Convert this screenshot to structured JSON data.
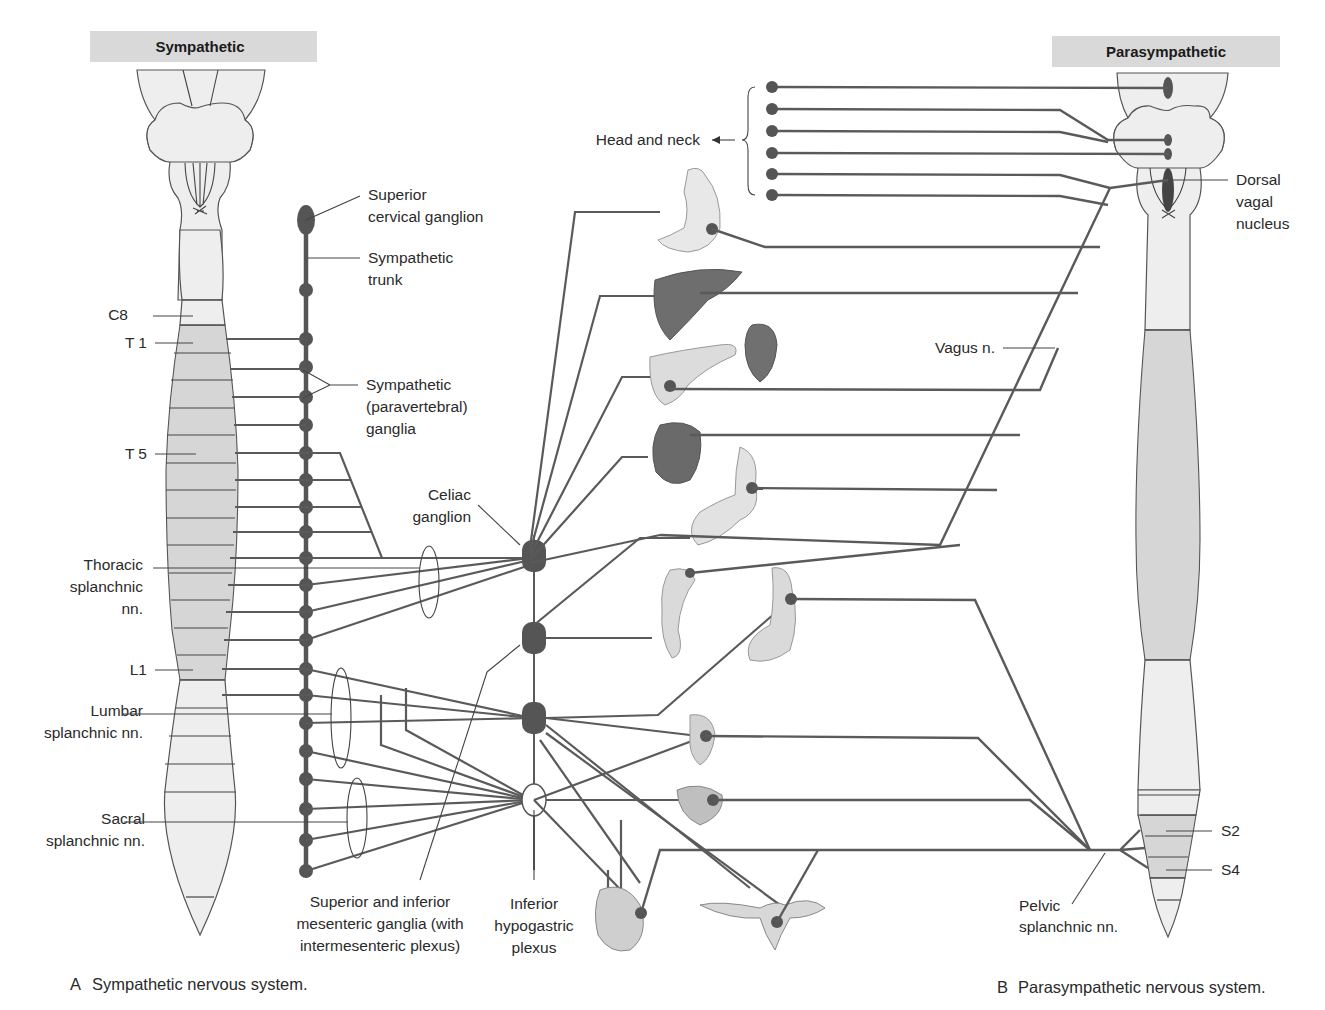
{
  "headers": {
    "sympathetic": "Sympathetic",
    "parasympathetic": "Parasympathetic"
  },
  "sympathetic_labels": {
    "superior_cervical_1": "Superior",
    "superior_cervical_2": "cervical ganglion",
    "trunk_1": "Sympathetic",
    "trunk_2": "trunk",
    "paravertebral_1": "Sympathetic",
    "paravertebral_2": "(paravertebral)",
    "paravertebral_3": "ganglia",
    "celiac_1": "Celiac",
    "celiac_2": "ganglion",
    "thoracic_1": "Thoracic",
    "thoracic_2": "splanchnic",
    "thoracic_3": "nn.",
    "lumbar_1": "Lumbar",
    "lumbar_2": "splanchnic nn.",
    "sacral_1": "Sacral",
    "sacral_2": "splanchnic nn.",
    "mesenteric_1": "Superior and inferior",
    "mesenteric_2": "mesenteric ganglia (with",
    "mesenteric_3": "intermesenteric plexus)",
    "hypogastric_1": "Inferior",
    "hypogastric_2": "hypogastric",
    "hypogastric_3": "plexus"
  },
  "segments_left": {
    "c8": "C8",
    "t1": "T 1",
    "t5": "T 5",
    "l1": "L1"
  },
  "parasympathetic_labels": {
    "head_neck": "Head and neck",
    "dorsal_1": "Dorsal",
    "dorsal_2": "vagal",
    "dorsal_3": "nucleus",
    "vagus": "Vagus n.",
    "pelvic_1": "Pelvic",
    "pelvic_2": "splanchnic nn."
  },
  "segments_right": {
    "s2": "S2",
    "s4": "S4"
  },
  "captions": {
    "a_letter": "A",
    "a_text": "Sympathetic nervous system.",
    "b_letter": "B",
    "b_text": "Parasympathetic nervous system."
  },
  "organs": [
    "stomach",
    "liver",
    "pancreas",
    "spleen",
    "kidney",
    "small-intestine",
    "colon-ascending",
    "colon-descending",
    "rectum",
    "bladder",
    "male-genitalia",
    "uterus-ovaries"
  ],
  "colors": {
    "header_bg": "#d9d9d9",
    "cord_light": "#eeeeee",
    "cord_dark": "#d6d6d6",
    "nerve": "#5a5a5a",
    "ganglion": "#555555"
  }
}
